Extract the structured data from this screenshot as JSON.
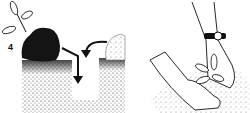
{
  "illustration": {
    "step_number": "4",
    "panels": [
      {
        "name": "planting-hole-panel",
        "description": "Seedling with dark soil clump beside a dug hole, loose soil mound, arrows pointing into hole"
      },
      {
        "name": "hands-planting-panel",
        "description": "Hands with wristwatch pressing soil around planted seedling"
      }
    ],
    "colors": {
      "ink": "#111111",
      "paper": "#ffffff",
      "soil": "#8a8a8a"
    }
  }
}
